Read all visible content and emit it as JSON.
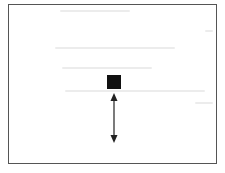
{
  "diagram": {
    "frame": {
      "border_color": "#555555",
      "background": "#ffffff"
    },
    "marker": {
      "shape": "square",
      "color": "#111111"
    },
    "arrow": {
      "type": "double-headed-vertical",
      "color": "#222222"
    }
  }
}
